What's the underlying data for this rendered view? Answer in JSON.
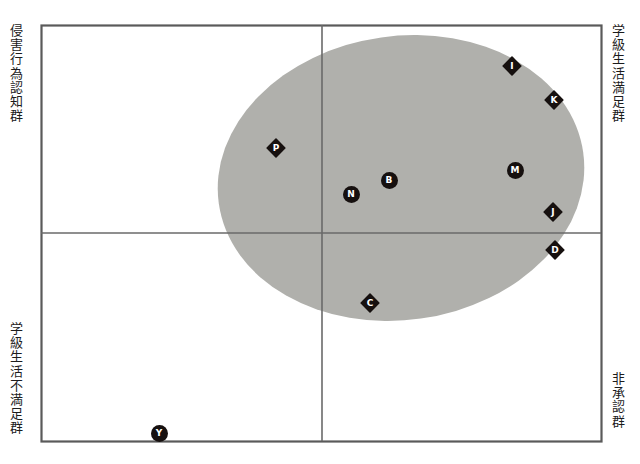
{
  "figure": {
    "type": "scatter",
    "title": "",
    "quadrant_labels": {
      "top_left": "侵害行為認知群",
      "bottom_left": "学級生活不満足群",
      "top_right": "学級生活満足群",
      "bottom_right": "非承認群"
    },
    "frame": {
      "x": 41,
      "y": 25,
      "width": 560,
      "height": 416
    },
    "divider_x": 322,
    "divider_y": 233,
    "ellipse": {
      "cx": 401,
      "cy": 178,
      "rx": 184,
      "ry": 142,
      "rotation_deg": -8,
      "fill": "#b0b0ac"
    },
    "colors": {
      "frame_stroke": "#5a5a5a",
      "divider_stroke": "#6a6a6a",
      "marker_fill": "#16100f",
      "marker_text": "#ffffff",
      "ellipse_fill": "#b0b0ac",
      "background": "#ffffff"
    }
  },
  "chart_data": {
    "type": "scatter",
    "title": "",
    "xlabel": "",
    "ylabel": "",
    "xlim": [
      41,
      601
    ],
    "ylim": [
      441,
      25
    ],
    "grid": false,
    "legend": null,
    "annotations": [
      "侵害行為認知群",
      "学級生活満足群",
      "学級生活不満足群",
      "非承認群"
    ],
    "points": [
      {
        "label": "I",
        "x": 512,
        "y": 66,
        "shape": "diamond"
      },
      {
        "label": "K",
        "x": 554,
        "y": 100,
        "shape": "diamond"
      },
      {
        "label": "P",
        "x": 276,
        "y": 148,
        "shape": "diamond"
      },
      {
        "label": "M",
        "x": 515,
        "y": 170,
        "shape": "circle"
      },
      {
        "label": "B",
        "x": 389,
        "y": 180,
        "shape": "circle"
      },
      {
        "label": "N",
        "x": 351,
        "y": 194,
        "shape": "circle"
      },
      {
        "label": "J",
        "x": 553,
        "y": 212,
        "shape": "diamond"
      },
      {
        "label": "D",
        "x": 555,
        "y": 250,
        "shape": "diamond"
      },
      {
        "label": "C",
        "x": 370,
        "y": 303,
        "shape": "diamond"
      },
      {
        "label": "Y",
        "x": 159,
        "y": 433,
        "shape": "circle"
      }
    ]
  }
}
